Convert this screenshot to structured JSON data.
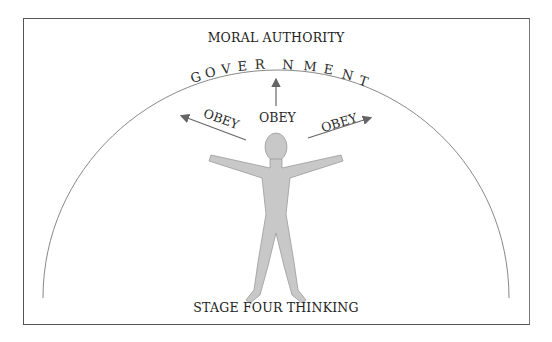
{
  "diagram": {
    "title": "MORAL AUTHORITY",
    "arc_label": "GOVERNMENT",
    "arc_letters": [
      "G",
      "O",
      "V",
      "E",
      "R",
      "N",
      "M",
      "E",
      "N",
      "T"
    ],
    "arrows": [
      {
        "direction": "up-left",
        "label": "OBEY"
      },
      {
        "direction": "up",
        "label": "OBEY"
      },
      {
        "direction": "up-right",
        "label": "OBEY"
      }
    ],
    "figure": "human-silhouette",
    "caption": "STAGE FOUR THINKING",
    "colors": {
      "figure_fill": "#c8c8c8",
      "figure_stroke": "#9a9a9a",
      "arrow": "#666666",
      "arc": "#888888",
      "border": "#555555",
      "text": "#222222"
    }
  }
}
